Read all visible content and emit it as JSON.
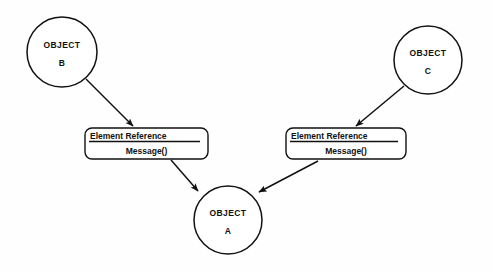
{
  "diagram": {
    "type": "uml-collaboration-diagram",
    "background_color": "#fefefe",
    "stroke_color": "#111111",
    "nodes": [
      {
        "id": "object-b",
        "shape": "circle",
        "line_one": "OBJECT",
        "line_two": "B",
        "cx": 62,
        "cy": 52,
        "r": 35
      },
      {
        "id": "object-c",
        "shape": "circle",
        "line_one": "OBJECT",
        "line_two": "C",
        "cx": 428,
        "cy": 60,
        "r": 34
      },
      {
        "id": "object-a",
        "shape": "circle",
        "line_one": "OBJECT",
        "line_two": "A",
        "cx": 228,
        "cy": 220,
        "r": 34
      }
    ],
    "message_boxes": [
      {
        "id": "message-box-left",
        "reference_label": "Element Reference",
        "message_label": "Message()",
        "x": 85,
        "y": 128,
        "width": 123,
        "height": 31
      },
      {
        "id": "message-box-right",
        "reference_label": "Element Reference",
        "message_label": "Message()",
        "x": 286,
        "y": 128,
        "width": 120,
        "height": 31
      }
    ],
    "arrows": [
      {
        "id": "arrow-b-to-left-box",
        "from": "object-b",
        "to": "message-box-left",
        "x1": 86,
        "y1": 79,
        "x2": 133,
        "y2": 126
      },
      {
        "id": "arrow-left-box-to-a",
        "from": "message-box-left",
        "to": "object-a",
        "x1": 171,
        "y1": 160,
        "x2": 198,
        "y2": 191
      },
      {
        "id": "arrow-c-to-right-box",
        "from": "object-c",
        "to": "message-box-right",
        "x1": 404,
        "y1": 86,
        "x2": 356,
        "y2": 126
      },
      {
        "id": "arrow-right-box-to-a",
        "from": "message-box-right",
        "to": "object-a",
        "x1": 318,
        "y1": 161,
        "x2": 259,
        "y2": 192
      }
    ]
  }
}
